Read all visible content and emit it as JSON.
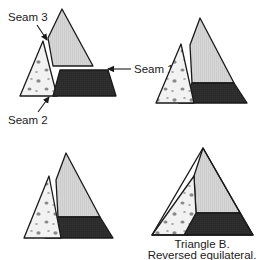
{
  "figure": {
    "caption": {
      "line1": "Triangle B.",
      "line2": "Reversed equilateral."
    },
    "labels": {
      "seam1": "Seam 1",
      "seam2": "Seam 2",
      "seam3": "Seam 3"
    },
    "colors": {
      "background": "#ffffff",
      "outline": "#1a1a1a",
      "piece_light_gray": "#d4d4d4",
      "piece_dark": "#2b2b2b",
      "piece_speckled_base": "#f2f2f2",
      "speckle_dot": "#8a8a8a",
      "text": "#1a1a1a"
    },
    "pieces": [
      {
        "id": "top-wedge",
        "name": "Top wedge",
        "fill": "light-gray",
        "description": "Tall narrow triangular wedge forming the upper right of the block"
      },
      {
        "id": "left-wedge",
        "name": "Left wedge",
        "fill": "speckled",
        "description": "Speckled triangular wedge forming the left side of the block"
      },
      {
        "id": "bottom-trapezoid",
        "name": "Bottom trapezoid",
        "fill": "dark",
        "description": "Dark trapezoid forming the lower right of the block"
      }
    ],
    "panels": [
      {
        "id": "panel-exploded",
        "name": "Exploded pieces with seam callouts",
        "position": "top-left",
        "state": "exploded",
        "has_labels": true
      },
      {
        "id": "panel-step-1",
        "name": "Top wedge joined to bottom trapezoid",
        "position": "top-right",
        "state": "partially-assembled",
        "has_labels": false
      },
      {
        "id": "panel-step-2",
        "name": "Left wedge nearly joined",
        "position": "bottom-left",
        "state": "nearly-assembled",
        "has_labels": false
      },
      {
        "id": "panel-complete",
        "name": "Completed triangle block",
        "position": "bottom-right",
        "state": "assembled",
        "has_labels": false
      }
    ]
  }
}
